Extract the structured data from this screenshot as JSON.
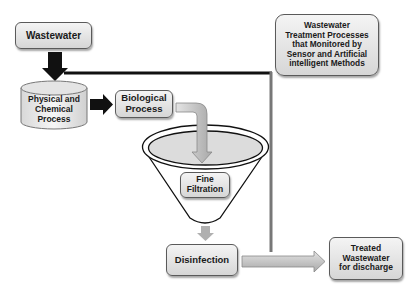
{
  "diagram": {
    "nodes": {
      "wastewater": "Wastewater",
      "physical_chemical": "Physical and\nChemical\nProcess",
      "biological": "Biological\nProcess",
      "fine_filtration": "Fine\nFiltration",
      "disinfection": "Disinfection",
      "treated": "Treated\nWastewater\nfor discharge",
      "legend": "Wastewater\nTreatment Processes\nthat Monitored by\nSensor and Artificial\nintelligent Methods"
    },
    "edges": [
      {
        "from": "wastewater",
        "to": "physical_chemical",
        "style": "black-arrow"
      },
      {
        "from": "physical_chemical",
        "to": "biological",
        "style": "black-arrow"
      },
      {
        "from": "biological",
        "to": "fine_filtration",
        "style": "gray-bent-arrow"
      },
      {
        "from": "fine_filtration",
        "to": "disinfection",
        "style": "gray-arrow"
      },
      {
        "from": "disinfection",
        "to": "treated",
        "style": "gray-arrow"
      },
      {
        "from": "wastewater",
        "to": "treated",
        "style": "bypass-line"
      }
    ],
    "colors": {
      "box_fill_top": "#f4f4f4",
      "box_fill_bottom": "#d6d6d6",
      "border": "#5a5a5a",
      "arrow_black": "#111111",
      "arrow_gray": "#b8b8b8"
    }
  }
}
